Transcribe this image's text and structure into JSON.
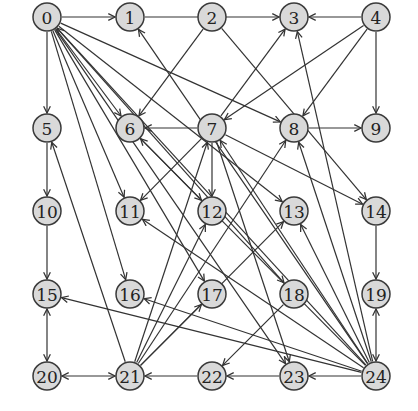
{
  "diagram": {
    "type": "directed-graph",
    "node_radius": 14,
    "colors": {
      "node_fill": "#d9d9d9",
      "node_stroke": "#3a3a3a",
      "edge": "#333333",
      "background": "#ffffff"
    },
    "nodes": [
      {
        "id": "0",
        "label": "0",
        "x": 47,
        "y": 17
      },
      {
        "id": "1",
        "label": "1",
        "x": 130,
        "y": 17
      },
      {
        "id": "2",
        "label": "2",
        "x": 212,
        "y": 17
      },
      {
        "id": "3",
        "label": "3",
        "x": 294,
        "y": 17
      },
      {
        "id": "4",
        "label": "4",
        "x": 376,
        "y": 17
      },
      {
        "id": "5",
        "label": "5",
        "x": 47,
        "y": 128
      },
      {
        "id": "6",
        "label": "6",
        "x": 130,
        "y": 128
      },
      {
        "id": "7",
        "label": "7",
        "x": 212,
        "y": 128
      },
      {
        "id": "8",
        "label": "8",
        "x": 294,
        "y": 128
      },
      {
        "id": "9",
        "label": "9",
        "x": 376,
        "y": 128
      },
      {
        "id": "10",
        "label": "10",
        "x": 47,
        "y": 211
      },
      {
        "id": "11",
        "label": "11",
        "x": 130,
        "y": 211
      },
      {
        "id": "12",
        "label": "12",
        "x": 212,
        "y": 211
      },
      {
        "id": "13",
        "label": "13",
        "x": 294,
        "y": 211
      },
      {
        "id": "14",
        "label": "14",
        "x": 376,
        "y": 211
      },
      {
        "id": "15",
        "label": "15",
        "x": 47,
        "y": 294
      },
      {
        "id": "16",
        "label": "16",
        "x": 130,
        "y": 294
      },
      {
        "id": "17",
        "label": "17",
        "x": 212,
        "y": 294
      },
      {
        "id": "18",
        "label": "18",
        "x": 294,
        "y": 294
      },
      {
        "id": "19",
        "label": "19",
        "x": 376,
        "y": 294
      },
      {
        "id": "20",
        "label": "20",
        "x": 47,
        "y": 376
      },
      {
        "id": "21",
        "label": "21",
        "x": 130,
        "y": 376
      },
      {
        "id": "22",
        "label": "22",
        "x": 212,
        "y": 376
      },
      {
        "id": "23",
        "label": "23",
        "x": 294,
        "y": 376
      },
      {
        "id": "24",
        "label": "24",
        "x": 376,
        "y": 376
      }
    ],
    "edges": [
      {
        "from": "0",
        "to": "1",
        "dir": "forward"
      },
      {
        "from": "1",
        "to": "3",
        "dir": "forward"
      },
      {
        "from": "4",
        "to": "3",
        "dir": "forward"
      },
      {
        "from": "4",
        "to": "9",
        "dir": "forward"
      },
      {
        "from": "4",
        "to": "7",
        "dir": "forward"
      },
      {
        "from": "4",
        "to": "8",
        "dir": "forward"
      },
      {
        "from": "0",
        "to": "5",
        "dir": "forward"
      },
      {
        "from": "5",
        "to": "10",
        "dir": "forward"
      },
      {
        "from": "10",
        "to": "15",
        "dir": "forward"
      },
      {
        "from": "15",
        "to": "20",
        "dir": "both"
      },
      {
        "from": "20",
        "to": "21",
        "dir": "both"
      },
      {
        "from": "22",
        "to": "21",
        "dir": "forward"
      },
      {
        "from": "23",
        "to": "22",
        "dir": "forward"
      },
      {
        "from": "24",
        "to": "23",
        "dir": "forward"
      },
      {
        "from": "14",
        "to": "19",
        "dir": "forward"
      },
      {
        "from": "19",
        "to": "24",
        "dir": "both"
      },
      {
        "from": "2",
        "to": "6",
        "dir": "forward"
      },
      {
        "from": "2",
        "to": "14",
        "dir": "forward"
      },
      {
        "from": "7",
        "to": "6",
        "dir": "forward"
      },
      {
        "from": "7",
        "to": "3",
        "dir": "forward"
      },
      {
        "from": "7",
        "to": "12",
        "dir": "forward"
      },
      {
        "from": "7",
        "to": "11",
        "dir": "forward"
      },
      {
        "from": "7",
        "to": "14",
        "dir": "forward"
      },
      {
        "from": "7",
        "to": "23",
        "dir": "forward"
      },
      {
        "from": "8",
        "to": "9",
        "dir": "forward"
      },
      {
        "from": "0",
        "to": "6",
        "dir": "forward"
      },
      {
        "from": "0",
        "to": "8",
        "dir": "forward"
      },
      {
        "from": "0",
        "to": "11",
        "dir": "forward"
      },
      {
        "from": "0",
        "to": "16",
        "dir": "forward"
      },
      {
        "from": "0",
        "to": "13",
        "dir": "forward"
      },
      {
        "from": "0",
        "to": "18",
        "dir": "forward"
      },
      {
        "from": "0",
        "to": "17",
        "dir": "forward"
      },
      {
        "from": "0",
        "to": "23",
        "dir": "forward"
      },
      {
        "from": "24",
        "to": "0",
        "dir": "forward"
      },
      {
        "from": "24",
        "to": "1",
        "dir": "forward"
      },
      {
        "from": "24",
        "to": "3",
        "dir": "forward"
      },
      {
        "from": "24",
        "to": "8",
        "dir": "forward"
      },
      {
        "from": "24",
        "to": "13",
        "dir": "forward"
      },
      {
        "from": "24",
        "to": "11",
        "dir": "forward"
      },
      {
        "from": "24",
        "to": "15",
        "dir": "forward"
      },
      {
        "from": "24",
        "to": "16",
        "dir": "forward"
      },
      {
        "from": "24",
        "to": "7",
        "dir": "forward"
      },
      {
        "from": "24",
        "to": "6",
        "dir": "forward"
      },
      {
        "from": "21",
        "to": "5",
        "dir": "forward"
      },
      {
        "from": "21",
        "to": "7",
        "dir": "forward"
      },
      {
        "from": "21",
        "to": "8",
        "dir": "forward"
      },
      {
        "from": "21",
        "to": "12",
        "dir": "forward"
      },
      {
        "from": "21",
        "to": "13",
        "dir": "forward"
      },
      {
        "from": "21",
        "to": "17",
        "dir": "forward"
      },
      {
        "from": "18",
        "to": "22",
        "dir": "forward"
      },
      {
        "from": "6",
        "to": "12",
        "dir": "forward"
      }
    ]
  }
}
